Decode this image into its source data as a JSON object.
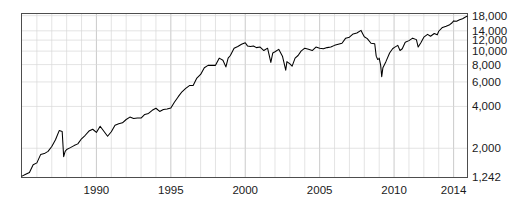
{
  "chart_data": {
    "type": "line",
    "title": "",
    "subtitle": "",
    "xlabel": "",
    "ylabel": "",
    "yscale": "log",
    "ylim": [
      1242,
      18500
    ],
    "xlim": [
      1985.0,
      2014.9
    ],
    "grid": true,
    "legend": null,
    "series_name": "Dow Jones Industrial Average",
    "line_color": "#000000",
    "grid_color": "#d9d9d9",
    "frame_color": "#4d4d4d",
    "background_color": "#ffffff",
    "y_ticks": [
      {
        "value": 18000,
        "label": "18,000"
      },
      {
        "value": 14000,
        "label": "14,000"
      },
      {
        "value": 12000,
        "label": "12,000"
      },
      {
        "value": 10000,
        "label": "10,000"
      },
      {
        "value": 8000,
        "label": "8,000"
      },
      {
        "value": 6000,
        "label": "6,000"
      },
      {
        "value": 4000,
        "label": "4,000"
      },
      {
        "value": 2000,
        "label": "2,000"
      },
      {
        "value": 1242,
        "label": "1,242"
      }
    ],
    "x_ticks": [
      {
        "value": 1990,
        "label": "1990"
      },
      {
        "value": 1995,
        "label": "1995"
      },
      {
        "value": 2000,
        "label": "2000"
      },
      {
        "value": 2005,
        "label": "2005"
      },
      {
        "value": 2010,
        "label": "2010"
      },
      {
        "value": 2014,
        "label": "2014"
      }
    ],
    "x_minor_ticks": [
      1986,
      1987,
      1988,
      1989,
      1991,
      1992,
      1993,
      1994,
      1996,
      1997,
      1998,
      1999,
      2001,
      2002,
      2003,
      2004,
      2006,
      2007,
      2008,
      2009,
      2011,
      2012,
      2013
    ],
    "x": [
      1985.0,
      1985.25,
      1985.5,
      1985.75,
      1986.0,
      1986.25,
      1986.5,
      1986.75,
      1987.0,
      1987.25,
      1987.5,
      1987.7,
      1987.8,
      1987.9,
      1988.0,
      1988.25,
      1988.5,
      1988.75,
      1989.0,
      1989.25,
      1989.5,
      1989.75,
      1990.0,
      1990.25,
      1990.5,
      1990.75,
      1991.0,
      1991.25,
      1991.5,
      1991.75,
      1992.0,
      1992.25,
      1992.5,
      1992.75,
      1993.0,
      1993.25,
      1993.5,
      1993.75,
      1994.0,
      1994.25,
      1994.5,
      1994.75,
      1995.0,
      1995.25,
      1995.5,
      1995.75,
      1996.0,
      1996.25,
      1996.5,
      1996.75,
      1997.0,
      1997.25,
      1997.5,
      1997.75,
      1998.0,
      1998.25,
      1998.5,
      1998.7,
      1998.85,
      1999.0,
      1999.25,
      1999.5,
      1999.75,
      2000.0,
      2000.15,
      2000.35,
      2000.55,
      2000.75,
      2001.0,
      2001.25,
      2001.5,
      2001.72,
      2001.85,
      2002.0,
      2002.25,
      2002.5,
      2002.72,
      2002.8,
      2003.0,
      2003.15,
      2003.35,
      2003.55,
      2003.75,
      2004.0,
      2004.25,
      2004.5,
      2004.75,
      2005.0,
      2005.25,
      2005.5,
      2005.75,
      2006.0,
      2006.25,
      2006.5,
      2006.75,
      2007.0,
      2007.25,
      2007.5,
      2007.78,
      2007.9,
      2008.0,
      2008.2,
      2008.45,
      2008.7,
      2008.8,
      2008.9,
      2008.97,
      2009.0,
      2009.1,
      2009.17,
      2009.25,
      2009.45,
      2009.7,
      2009.9,
      2010.0,
      2010.25,
      2010.4,
      2010.55,
      2010.75,
      2011.0,
      2011.25,
      2011.5,
      2011.62,
      2011.8,
      2012.0,
      2012.25,
      2012.45,
      2012.7,
      2012.9,
      2013.0,
      2013.25,
      2013.5,
      2013.7,
      2013.9,
      2014.0,
      2014.2,
      2014.4,
      2014.6,
      2014.8,
      2014.9
    ],
    "values": [
      1260,
      1300,
      1340,
      1520,
      1570,
      1800,
      1830,
      1900,
      2060,
      2300,
      2680,
      2640,
      1740,
      1900,
      1960,
      2020,
      2090,
      2150,
      2340,
      2480,
      2660,
      2740,
      2600,
      2880,
      2650,
      2440,
      2630,
      2930,
      3000,
      3050,
      3220,
      3350,
      3280,
      3300,
      3300,
      3500,
      3560,
      3750,
      3880,
      3680,
      3800,
      3830,
      3900,
      4300,
      4700,
      5100,
      5400,
      5650,
      5650,
      6400,
      6800,
      7600,
      7900,
      7900,
      7900,
      8900,
      8600,
      7700,
      8900,
      9300,
      10500,
      10800,
      11200,
      11500,
      10900,
      10800,
      10900,
      10600,
      10700,
      10100,
      10500,
      8300,
      9700,
      9900,
      10300,
      9200,
      7300,
      8400,
      8100,
      7800,
      8900,
      9300,
      10000,
      10500,
      10300,
      10100,
      10700,
      10500,
      10400,
      10600,
      10700,
      11000,
      11200,
      11400,
      12400,
      12600,
      13300,
      13500,
      14100,
      13300,
      12700,
      12300,
      11400,
      11300,
      9200,
      8700,
      8800,
      8900,
      7900,
      6550,
      7600,
      8400,
      9700,
      10400,
      10600,
      11000,
      10100,
      10400,
      11600,
      11900,
      12400,
      12100,
      10700,
      11500,
      12600,
      13200,
      12800,
      13400,
      13100,
      13900,
      14800,
      15100,
      15400,
      16000,
      16500,
      16400,
      16800,
      17100,
      17600,
      17800
    ]
  }
}
